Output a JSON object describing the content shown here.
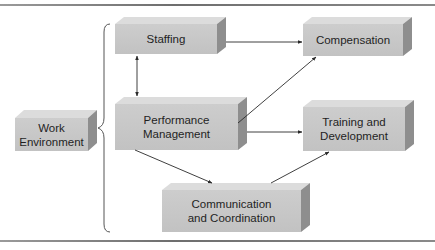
{
  "diagram": {
    "type": "flow",
    "nodes": [
      {
        "id": "work-environment",
        "label": "Work\nEnvironment"
      },
      {
        "id": "staffing",
        "label": "Staffing"
      },
      {
        "id": "performance-management",
        "label": "Performance\nManagement"
      },
      {
        "id": "compensation",
        "label": "Compensation"
      },
      {
        "id": "training-development",
        "label": "Training and\nDevelopment"
      },
      {
        "id": "communication-coordination",
        "label": "Communication\nand Coordination"
      }
    ],
    "edges": [
      {
        "from": "staffing",
        "to": "performance-management",
        "direction": "both"
      },
      {
        "from": "staffing",
        "to": "compensation",
        "direction": "forward"
      },
      {
        "from": "performance-management",
        "to": "compensation",
        "direction": "forward"
      },
      {
        "from": "performance-management",
        "to": "training-development",
        "direction": "forward"
      },
      {
        "from": "performance-management",
        "to": "communication-coordination",
        "direction": "forward"
      },
      {
        "from": "communication-coordination",
        "to": "training-development",
        "direction": "forward"
      }
    ],
    "grouping": {
      "type": "brace",
      "from": "work-environment",
      "encloses": [
        "staffing",
        "performance-management",
        "communication-coordination"
      ]
    },
    "colors": {
      "box_front": "#c6c6c6",
      "box_top": "#dcdcdc",
      "box_side": "#8e8e8e",
      "line": "#3a3a3a",
      "text": "#1f1f1f"
    }
  }
}
